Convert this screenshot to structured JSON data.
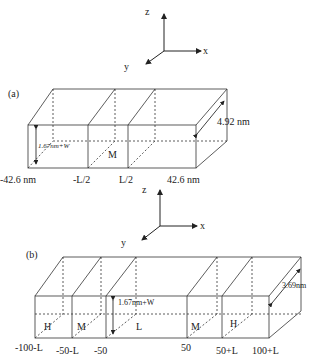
{
  "panel_a": {
    "tag": "(a)",
    "axes": {
      "x": "x",
      "y": "y",
      "z": "z"
    },
    "height_label": "1.67nm+W",
    "depth_label": "4.92 nm",
    "region_labels": [
      "M"
    ],
    "tick_labels": [
      "-42.6 nm",
      "-L/2",
      "L/2",
      "42.6 nm"
    ]
  },
  "panel_b": {
    "tag": "(b)",
    "axes": {
      "x": "x",
      "y": "y",
      "z": "z"
    },
    "height_label": "1.67nm+W",
    "depth_label": "3.69nm",
    "region_labels": [
      "H",
      "M",
      "L",
      "M",
      "H"
    ],
    "tick_labels": [
      "-100-L",
      "-50-L",
      "-50",
      "50",
      "50+L",
      "100+L"
    ]
  },
  "colors": {
    "line": "#333333",
    "background": "#ffffff"
  }
}
